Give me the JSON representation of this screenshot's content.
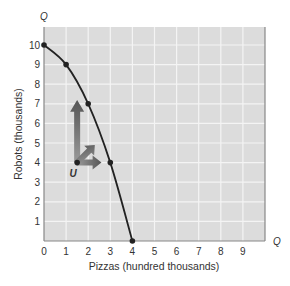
{
  "chart_data": {
    "type": "line",
    "title": "",
    "xlabel": "Pizzas (hundred thousands)",
    "ylabel": "Robots (thousands)",
    "x_axis_end_label": "Q",
    "y_axis_end_label": "Q",
    "xlim": [
      0,
      10
    ],
    "ylim": [
      0,
      10.9
    ],
    "x_ticks": [
      "0",
      "1",
      "2",
      "3",
      "4",
      "5",
      "6",
      "7",
      "8",
      "9"
    ],
    "y_ticks": [
      "1",
      "2",
      "3",
      "4",
      "5",
      "6",
      "7",
      "8",
      "9",
      "10"
    ],
    "grid": true,
    "series": [
      {
        "name": "Production possibilities curve",
        "points": [
          {
            "x": 0,
            "y": 10
          },
          {
            "x": 1,
            "y": 9
          },
          {
            "x": 2,
            "y": 7
          },
          {
            "x": 3,
            "y": 4
          },
          {
            "x": 4,
            "y": 0
          }
        ]
      }
    ],
    "annotations": [
      {
        "label": "U",
        "x": 1.5,
        "y": 4,
        "type": "point"
      },
      {
        "type": "arrows",
        "from": {
          "x": 1.5,
          "y": 4
        },
        "directions": [
          "up",
          "up-right",
          "right"
        ]
      }
    ]
  },
  "colors": {
    "plot_bg": "#dcdcdc",
    "grid": "#f4f4f4",
    "curve": "#222222",
    "arrow": "#777777"
  }
}
